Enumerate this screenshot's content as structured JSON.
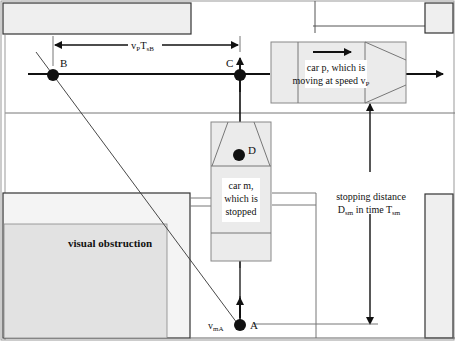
{
  "labels": {
    "point_b": "B",
    "point_c": "C",
    "point_d": "D",
    "point_a": "A",
    "dim_vp": "v",
    "dim_vp_sub": "P",
    "dim_t": "T",
    "dim_t_sub": "sB",
    "car_p_line1": "car p, which is",
    "car_p_line2": "moving at speed v",
    "car_p_sub": "P",
    "car_m_line1": "car m,",
    "car_m_line2": "which is",
    "car_m_line3": "stopped",
    "stop_line1": "stopping distance",
    "stop_line2_a": "D",
    "stop_line2_a_sub": "sm",
    "stop_line2_b": " in time T",
    "stop_line2_b_sub": "sm",
    "obstruction": "visual obstruction",
    "v_ma": "v",
    "v_ma_sub": "mA"
  },
  "colors": {
    "fill_light": "#ececec",
    "fill_obstruction": "#e2e2e2",
    "stroke": "#333333",
    "thin": "#777777",
    "dot": "#111111"
  }
}
